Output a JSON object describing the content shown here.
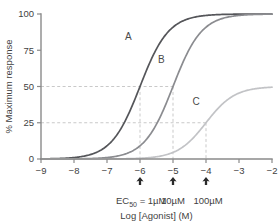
{
  "chart_data": {
    "type": "line",
    "title": "",
    "xlabel": "Log [Agonist] (M)",
    "ylabel": "% Maximum response",
    "xlim": [
      -9,
      -2
    ],
    "ylim": [
      0,
      100
    ],
    "xticks": [
      -9,
      -8,
      -7,
      -6,
      -5,
      -4,
      -3,
      -2
    ],
    "xtick_labels": [
      "−9",
      "−8",
      "−7",
      "−6",
      "−5",
      "−4",
      "−3",
      "−2"
    ],
    "yticks": [
      0,
      25,
      50,
      75,
      100
    ],
    "ytick_labels": [
      "0",
      "25",
      "50",
      "75",
      "100"
    ],
    "grid": false,
    "legend": "inline-curve-labels",
    "series": [
      {
        "name": "A",
        "color": "#55565a",
        "ec50_log": -6,
        "emax": 100,
        "hill": 1,
        "label_x": -6.35,
        "label_y": 82
      },
      {
        "name": "B",
        "color": "#8b8c90",
        "ec50_log": -5,
        "emax": 100,
        "hill": 1,
        "label_x": -5.35,
        "label_y": 66
      },
      {
        "name": "C",
        "color": "#c2c3c6",
        "ec50_log": -4,
        "emax": 50,
        "hill": 1,
        "label_x": -4.3,
        "label_y": 37
      }
    ],
    "guides": [
      {
        "y": 50,
        "x_end": -5,
        "label": "50"
      },
      {
        "y": 25,
        "x_end": -4,
        "label": "25"
      }
    ],
    "drop_lines": [
      -6,
      -5,
      -4
    ],
    "markers": [
      {
        "x": -6,
        "type": "arrow-up"
      },
      {
        "x": -5,
        "type": "arrow-up"
      },
      {
        "x": -4,
        "type": "arrow-up"
      }
    ],
    "annotations": [
      {
        "text": "EC",
        "sub": "50",
        "tail": " = 1µM",
        "x": -6
      },
      {
        "text": "10µM",
        "x": -5
      },
      {
        "text": "100µM",
        "x": -4
      }
    ]
  },
  "axes": {
    "x_title": "Log [Agonist] (M)",
    "y_title": "% Maximum response"
  },
  "ec50_annotation": {
    "prefix": "EC",
    "subscript": "50",
    "equals": " = 1µM",
    "value_b": "10µM",
    "value_c": "100µM"
  }
}
